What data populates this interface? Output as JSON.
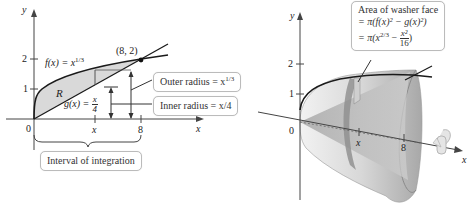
{
  "left_plot": {
    "axis_labels": {
      "x": "x",
      "y": "y"
    },
    "ticks": {
      "y": [
        "1",
        "2"
      ],
      "x": [
        "0",
        "x",
        "8"
      ]
    },
    "curve_f": {
      "label": "f(x) = x",
      "exponent": "1/3"
    },
    "curve_g": {
      "label_prefix": "g(x) = ",
      "num": "x",
      "den": "4"
    },
    "region_label": "R",
    "intersection_label": "(8, 2)",
    "outer_radius": {
      "text": "Outer radius = x",
      "exponent": "1/3"
    },
    "inner_radius": {
      "text": "Inner radius = x/4"
    },
    "interval_label": "Interval of integration"
  },
  "right_plot": {
    "axis_labels": {
      "x": "x",
      "y": "y"
    },
    "ticks": {
      "y": [
        "1",
        "2"
      ],
      "x": [
        "0",
        "x",
        "8"
      ]
    },
    "washer_box": {
      "line1": "Area of washer face",
      "line2": "= π(f(x)² − g(x)²)",
      "line3_prefix": "= π(x",
      "line3_exp": "2/3",
      "line3_minus": " − ",
      "line3_num": "x²",
      "line3_den": "16",
      "line3_suffix": ")"
    }
  },
  "colors": {
    "region_fill": "#d9d9d9",
    "curve": "#1a1a1a",
    "axis": "#444444",
    "solid_light": "#e6e6e6",
    "solid_dark": "#9a9a9a"
  }
}
